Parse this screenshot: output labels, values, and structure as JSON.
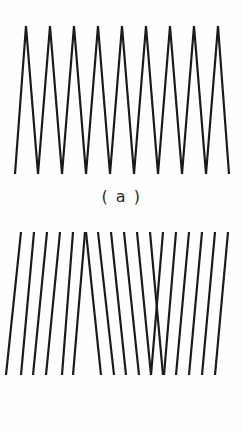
{
  "figure": {
    "background_color": "#fefefe",
    "stroke_color": "#1a1a1a",
    "caption_color": "#2b2b2b"
  },
  "panel_a": {
    "caption": "( a )",
    "icon": "zigzag-waveform-icon"
  },
  "panel_b": {
    "caption": "( b )",
    "icon": "sheared-zigzag-lines-icon"
  },
  "chart_data": [
    {
      "type": "line",
      "title": "( a )",
      "subtitle": "",
      "xlabel": "",
      "ylabel": "",
      "grid": false,
      "legend": "none",
      "description": "High-frequency triangular zigzag waveform with nine sharp peaks and eight valleys; continuous polyline drawn with uniform black stroke.",
      "stroke_color": "#1a1a1a",
      "stroke_width": 2.2,
      "xlim": [
        0,
        243
      ],
      "ylim": [
        0,
        182
      ],
      "peak_y": 26,
      "valley_y": 174,
      "peak_count": 9,
      "valley_count": 8,
      "x": [
        15,
        26,
        38,
        50,
        62,
        74,
        86,
        98,
        110,
        122,
        134,
        146,
        158,
        170,
        182,
        194,
        206,
        218,
        229
      ],
      "y": [
        174,
        26,
        174,
        26,
        174,
        26,
        174,
        26,
        174,
        26,
        174,
        26,
        174,
        26,
        174,
        26,
        174,
        26,
        174
      ],
      "peaks_x": [
        26,
        50,
        74,
        98,
        122,
        146,
        170,
        194,
        218
      ],
      "valleys_x": [
        15,
        38,
        62,
        86,
        110,
        134,
        158,
        182,
        206,
        229
      ]
    },
    {
      "type": "line",
      "title": "( b )",
      "subtitle": "",
      "xlabel": "",
      "ylabel": "",
      "grid": false,
      "legend": "none",
      "description": "Seventeen near-vertical line segments whose top endpoints are evenly spaced while their bottom endpoints shift, producing a shallow zigzag envelope with an apex near x=85 and a valley near x=163.",
      "stroke_color": "#1a1a1a",
      "stroke_width": 2.2,
      "xlim": [
        0,
        243
      ],
      "ylim": [
        0,
        163
      ],
      "top_y": 17,
      "bottom_y": 160,
      "segment_count": 17,
      "apex_x": 85,
      "valley_x": 163,
      "segments": [
        {
          "x_top": 21,
          "x_bottom": 6
        },
        {
          "x_top": 34,
          "x_bottom": 21
        },
        {
          "x_top": 47,
          "x_bottom": 33
        },
        {
          "x_top": 60,
          "x_bottom": 46
        },
        {
          "x_top": 73,
          "x_bottom": 62
        },
        {
          "x_top": 85,
          "x_bottom": 73
        },
        {
          "x_top": 86,
          "x_bottom": 101
        },
        {
          "x_top": 98,
          "x_bottom": 114
        },
        {
          "x_top": 111,
          "x_bottom": 126
        },
        {
          "x_top": 124,
          "x_bottom": 139
        },
        {
          "x_top": 137,
          "x_bottom": 151
        },
        {
          "x_top": 150,
          "x_bottom": 163
        },
        {
          "x_top": 163,
          "x_bottom": 151
        },
        {
          "x_top": 176,
          "x_bottom": 164
        },
        {
          "x_top": 189,
          "x_bottom": 176
        },
        {
          "x_top": 202,
          "x_bottom": 189
        },
        {
          "x_top": 215,
          "x_bottom": 202
        },
        {
          "x_top": 228,
          "x_bottom": 215
        }
      ]
    }
  ]
}
